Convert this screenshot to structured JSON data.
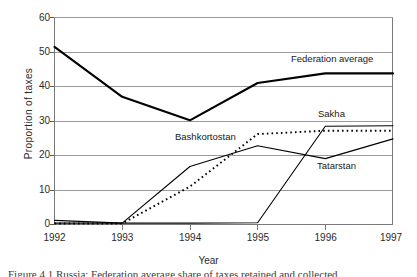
{
  "chart_data": {
    "type": "line",
    "title": "",
    "xlabel": "Year",
    "ylabel": "Proportion of  taxes",
    "categories": [
      "1992",
      "1993",
      "1994",
      "1995",
      "1996",
      "1997"
    ],
    "x": [
      1992,
      1993,
      1994,
      1995,
      1996,
      1997
    ],
    "xlim": [
      1992,
      1997
    ],
    "ylim": [
      0,
      60
    ],
    "yticks": [
      "0",
      "10",
      "20",
      "30",
      "40",
      "50",
      "60"
    ],
    "ytick_values": [
      0,
      10,
      20,
      30,
      40,
      50,
      60
    ],
    "grid": "horizontal",
    "legend": "inline-annotations",
    "series": [
      {
        "name": "Federation average",
        "style": "solid-thick",
        "color": "#000000",
        "values": [
          51.5,
          37.0,
          30.2,
          41.0,
          43.8,
          43.8
        ]
      },
      {
        "name": "Bashkortostan",
        "style": "dotted",
        "color": "#000000",
        "values": [
          0.3,
          0.3,
          11.0,
          26.2,
          27.2,
          27.2
        ]
      },
      {
        "name": "Tatarstan",
        "style": "solid-thin",
        "color": "#000000",
        "values": [
          1.2,
          0.4,
          16.8,
          22.8,
          19.1,
          24.8
        ]
      },
      {
        "name": "Sakha",
        "style": "solid-thin",
        "color": "#000000",
        "values": [
          0.4,
          0.4,
          0.4,
          0.5,
          28.5,
          28.6
        ]
      }
    ],
    "annotations": [
      {
        "text": "Federation average",
        "x": 1995.4,
        "y": 46.5
      },
      {
        "text": "Sakha",
        "x": 1996.6,
        "y": 32.0
      },
      {
        "text": "Bashkortostan",
        "x": 1993.6,
        "y": 25.5
      },
      {
        "text": "Tatarstan",
        "x": 1996.6,
        "y": 17.5
      }
    ]
  },
  "caption": {
    "text": "Figure 4.1  Russia: Federation average share of taxes retained and collected"
  }
}
